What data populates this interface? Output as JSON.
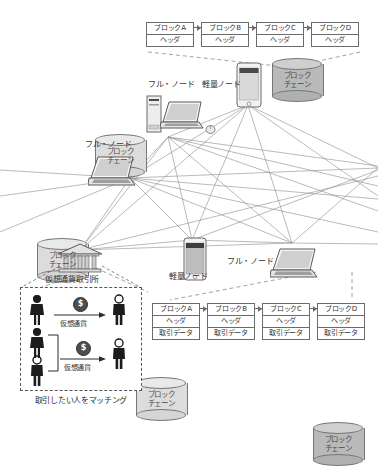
{
  "diagram": {
    "top_chain": {
      "blocks": [
        {
          "name": "ブロックA",
          "rows": [
            "ヘッダ"
          ]
        },
        {
          "name": "ブロックB",
          "rows": [
            "ヘッダ"
          ]
        },
        {
          "name": "ブロックC",
          "rows": [
            "ヘッダ"
          ]
        },
        {
          "name": "ブロックD",
          "rows": [
            "ヘッダ"
          ]
        }
      ]
    },
    "bottom_chain": {
      "blocks": [
        {
          "name": "ブロックA",
          "rows": [
            "ヘッダ",
            "取引データ"
          ]
        },
        {
          "name": "ブロックB",
          "rows": [
            "ヘッダ",
            "取引データ"
          ]
        },
        {
          "name": "ブロックC",
          "rows": [
            "ヘッダ",
            "取引データ"
          ]
        },
        {
          "name": "ブロックD",
          "rows": [
            "ヘッダ",
            "取引データ"
          ]
        }
      ]
    },
    "cylinders": [
      {
        "id": "cyl-top-right",
        "line1": "ブロック",
        "line2": "チェーン",
        "shade": "dark"
      },
      {
        "id": "cyl-upper-left",
        "line1": "ブロック",
        "line2": "チェーン",
        "shade": "light"
      },
      {
        "id": "cyl-mid-left",
        "line1": "ブロック",
        "line2": "チェーン",
        "shade": "light"
      },
      {
        "id": "cyl-center",
        "line1": "ブロック",
        "line2": "チェーン",
        "shade": "light"
      },
      {
        "id": "cyl-bottom-right",
        "line1": "ブロック",
        "line2": "チェーン",
        "shade": "dark"
      }
    ],
    "node_labels": {
      "full_node_upper": "フル・ノード",
      "light_node_upper": "軽量ノード",
      "full_node_left": "フル・ノード",
      "light_node_center": "軽量ノード",
      "full_node_right": "フル・ノード"
    },
    "exchange": {
      "title": "仮想通貨取引所",
      "caption": "取引したい人をマッチング",
      "transfer_label_1": "仮想通貨",
      "transfer_label_2": "仮想通貨",
      "coin_symbol": "$"
    },
    "colors": {
      "line": "#6b6b6b",
      "cylinder_light": "#dcdcdc",
      "cylinder_dark": "#b9b9b9",
      "text": "#333333",
      "dashed": "#555555"
    }
  }
}
